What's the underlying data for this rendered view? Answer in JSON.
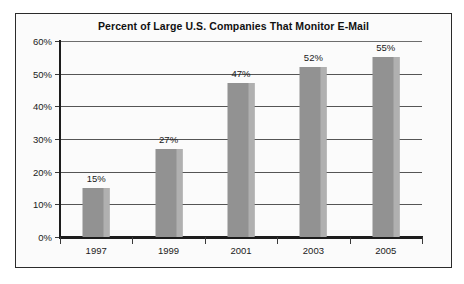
{
  "chart_data": {
    "type": "bar",
    "title": "Percent of Large U.S. Companies That Monitor E-Mail",
    "xlabel": "",
    "ylabel": "",
    "categories": [
      "1997",
      "1999",
      "2001",
      "2003",
      "2005"
    ],
    "values": [
      15,
      27,
      47,
      52,
      55
    ],
    "value_labels": [
      "15%",
      "27%",
      "47%",
      "52%",
      "55%"
    ],
    "ylim": [
      0,
      60
    ],
    "ytick_values": [
      0,
      10,
      20,
      30,
      40,
      50,
      60
    ],
    "ytick_labels": [
      "0%",
      "10%",
      "20%",
      "30%",
      "40%",
      "50%",
      "60%"
    ],
    "grid": true,
    "legend": false,
    "series": [
      {
        "name": "Percent of Large U.S. Companies That Monitor E-Mail",
        "values": [
          15,
          27,
          47,
          52,
          55
        ]
      }
    ],
    "colors": {
      "bar": "#929292",
      "bar_highlight": "#b0b0b0",
      "axis": "#1c1c1c",
      "gridline": "#555555",
      "text": "#1a1a1a",
      "frame": "#2b2b2b",
      "background": "#fbfbfb"
    }
  }
}
